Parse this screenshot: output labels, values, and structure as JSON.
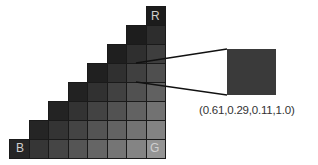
{
  "diagram": {
    "type": "triangular-color-grid",
    "grid_size": 8,
    "corner_labels": {
      "top_right": "R",
      "bottom_left": "B",
      "bottom_right": "G"
    },
    "highlighted_cell": {
      "row": 3,
      "col": 6
    },
    "callout_value": "(0.61,0.29,0.11,1.0)",
    "callout_color": "#3a3a3a"
  }
}
